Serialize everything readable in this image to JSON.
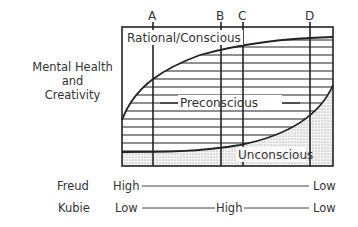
{
  "diagram": {
    "y_axis_label": [
      "Mental Health",
      "and",
      "Creativity"
    ],
    "markers": [
      {
        "label": "A",
        "x": 153
      },
      {
        "label": "B",
        "x": 221
      },
      {
        "label": "C",
        "x": 243
      },
      {
        "label": "D",
        "x": 310
      }
    ],
    "regions": {
      "top": "Rational/Conscious",
      "middle": "Preconscious",
      "bottom": "Unconscious"
    },
    "scales": [
      {
        "name": "Freud",
        "points": [
          "High",
          "Low"
        ]
      },
      {
        "name": "Kubie",
        "points": [
          "Low",
          "High",
          "Low"
        ]
      }
    ],
    "colors": {
      "line": "#222222",
      "stipple": "#888888"
    }
  }
}
